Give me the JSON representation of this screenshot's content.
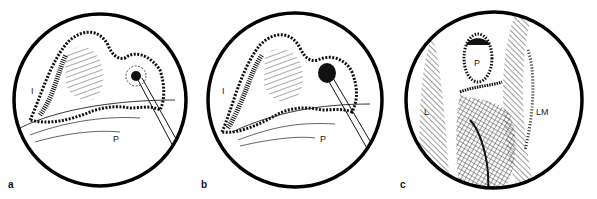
{
  "figure": {
    "panels": [
      {
        "id": "a",
        "label": "a",
        "annotations": [
          {
            "text": "I"
          },
          {
            "text": "P"
          }
        ]
      },
      {
        "id": "b",
        "label": "b",
        "annotations": [
          {
            "text": "I"
          },
          {
            "text": "P"
          }
        ]
      },
      {
        "id": "c",
        "label": "c",
        "annotations": [
          {
            "text": "P"
          },
          {
            "text": "L"
          },
          {
            "text": "LM"
          }
        ]
      }
    ],
    "colors": {
      "ink": "#111111",
      "background": "#ffffff"
    }
  }
}
